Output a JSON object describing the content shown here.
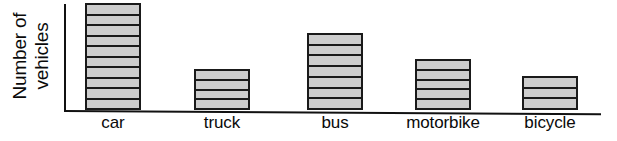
{
  "chart_data": {
    "type": "bar",
    "title": "",
    "xlabel": "",
    "ylabel": "Number of vehicles",
    "ylabel_line1": "Number of",
    "ylabel_line2": "vehicles",
    "categories": [
      "car",
      "truck",
      "bus",
      "motorbike",
      "bicycle"
    ],
    "values": [
      10,
      4,
      7,
      5,
      3
    ],
    "ylim": [
      0,
      10
    ],
    "grid": false,
    "legend": false,
    "colors": {
      "bar_fill": "#cdcdcd",
      "bar_stroke": "#1a1a1a",
      "axis": "#111111",
      "text": "#0a0a0a",
      "background": "#ffffff"
    },
    "bars": [
      {
        "label": "car",
        "units": 10,
        "left": 85,
        "width": 56,
        "top": 3,
        "bottom": 110
      },
      {
        "label": "truck",
        "units": 4,
        "left": 194,
        "width": 56,
        "top": 69,
        "bottom": 110
      },
      {
        "label": "bus",
        "units": 7,
        "left": 307,
        "width": 56,
        "top": 33,
        "bottom": 110
      },
      {
        "label": "motorbike",
        "units": 5,
        "left": 415,
        "width": 56,
        "top": 59,
        "bottom": 110
      },
      {
        "label": "bicycle",
        "units": 3,
        "left": 522,
        "width": 56,
        "top": 76,
        "bottom": 110
      }
    ]
  }
}
